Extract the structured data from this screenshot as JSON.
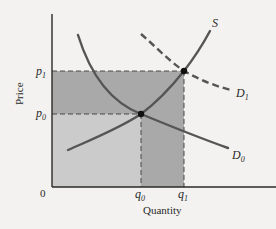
{
  "diagram": {
    "type": "supply-demand",
    "title": "",
    "axes": {
      "x_label": "Quantity",
      "y_label": "Price",
      "origin_label": "0"
    },
    "price_levels": [
      {
        "symbol": "p",
        "subscript": "0",
        "label": "p0"
      },
      {
        "symbol": "p",
        "subscript": "1",
        "label": "p1"
      }
    ],
    "quantity_levels": [
      {
        "symbol": "q",
        "subscript": "0",
        "label": "q0"
      },
      {
        "symbol": "q",
        "subscript": "1",
        "label": "q1"
      }
    ],
    "curves": [
      {
        "id": "S",
        "label": "S",
        "subscript": "",
        "style": "solid",
        "role": "supply"
      },
      {
        "id": "D0",
        "label": "D",
        "subscript": "0",
        "style": "solid",
        "role": "initial demand"
      },
      {
        "id": "D1",
        "label": "D",
        "subscript": "1",
        "style": "dashed",
        "role": "shifted demand"
      }
    ],
    "equilibria": [
      {
        "label": "E0",
        "price": "p0",
        "quantity": "q0"
      },
      {
        "label": "E1",
        "price": "p1",
        "quantity": "q1"
      }
    ],
    "shaded_regions": [
      {
        "id": "initial-revenue",
        "description": "rectangle 0 to q0 by 0 to p0",
        "color": "#c9c9c9"
      },
      {
        "id": "added-price-area",
        "description": "rectangle 0 to q1 between p0 and p1",
        "color": "#a8a8a8"
      },
      {
        "id": "added-quantity-area",
        "description": "rectangle q0 to q1 by 0 to p0",
        "color": "#a8a8a8"
      }
    ],
    "colors": {
      "background": "#f3f2f0",
      "axis": "#2a2a2a",
      "curve": "#555555",
      "light_shade": "#c9c9c9",
      "dark_shade": "#a8a8a8",
      "point": "#111111"
    }
  }
}
